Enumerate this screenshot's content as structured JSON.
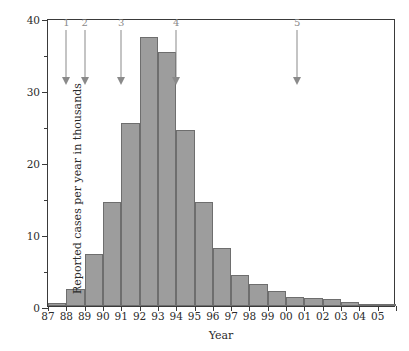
{
  "chart_data": {
    "type": "bar",
    "title": "",
    "xlabel": "Year",
    "ylabel": "Reported cases per year in thousands",
    "categories": [
      "87",
      "88",
      "89",
      "90",
      "91",
      "92",
      "93",
      "94",
      "95",
      "96",
      "97",
      "98",
      "99",
      "00",
      "01",
      "02",
      "03",
      "04",
      "05"
    ],
    "values": [
      0.4,
      2.3,
      7.2,
      14.4,
      25.4,
      37.4,
      35.3,
      24.5,
      14.5,
      8.1,
      4.3,
      3.0,
      2.1,
      1.3,
      1.1,
      1.0,
      0.6,
      0.3,
      0.2
    ],
    "ylim": [
      0,
      40
    ],
    "yticks": [
      0,
      10,
      20,
      30,
      40
    ],
    "ytick_labels": [
      "0",
      "10",
      "20",
      "30",
      "40"
    ],
    "yminor_ticks": [
      5,
      15,
      25,
      35
    ],
    "grid": false,
    "legend": "none",
    "bar_color": "#9d9d9d",
    "bar_edge_color": "#6e6e6e",
    "axis_color": "#3a3a3a",
    "annotation_color": "#8a8a8a",
    "annotations": [
      {
        "label": "1",
        "year": "88",
        "x_value": 88.0,
        "tip_value": 31.0
      },
      {
        "label": "2",
        "year": "89",
        "x_value": 89.0,
        "tip_value": 31.0
      },
      {
        "label": "3",
        "year": "91",
        "x_value": 91.0,
        "tip_value": 31.0
      },
      {
        "label": "4",
        "year": "94",
        "x_value": 94.0,
        "tip_value": 31.0
      },
      {
        "label": "5",
        "year": "01",
        "x_value": 100.6,
        "tip_value": 31.0
      }
    ]
  }
}
